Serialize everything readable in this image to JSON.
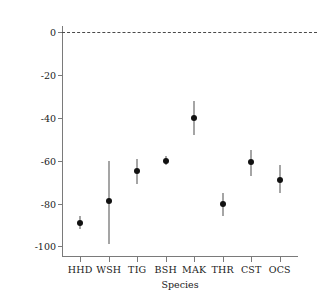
{
  "chart_data": {
    "type": "scatter",
    "title": "",
    "xlabel": "Species",
    "ylabel": "Estimated change in abundance",
    "categories": [
      "HHD",
      "WSH",
      "TIG",
      "BSH",
      "MAK",
      "THR",
      "CST",
      "OCS"
    ],
    "values": [
      -89,
      -79,
      -65,
      -60,
      -40,
      -80,
      -60.5,
      -69
    ],
    "error_low": [
      -92,
      -99,
      -71,
      -62,
      -48,
      -86,
      -67,
      -75
    ],
    "error_high": [
      -86,
      -60,
      -59,
      -58,
      -32,
      -75,
      -55,
      -62
    ],
    "ylim": [
      -105,
      3
    ],
    "yticks": [
      0,
      -20,
      -40,
      -60,
      -80,
      -100
    ],
    "ytick_labels": [
      "0",
      "-20",
      "-40",
      "-60",
      "-80",
      "-100"
    ],
    "grid": false,
    "legend": "none",
    "annotations": [
      {
        "name": "zero-reference-line",
        "type": "hline",
        "y": 0,
        "style": "dashed"
      }
    ],
    "series": [
      {
        "name": "Estimated change in abundance",
        "points": [
          {
            "category": "HHD",
            "value": -89,
            "ci_low": -92,
            "ci_high": -86
          },
          {
            "category": "WSH",
            "value": -79,
            "ci_low": -99,
            "ci_high": -60
          },
          {
            "category": "TIG",
            "value": -65,
            "ci_low": -71,
            "ci_high": -59
          },
          {
            "category": "BSH",
            "value": -60,
            "ci_low": -62,
            "ci_high": -58
          },
          {
            "category": "MAK",
            "value": -40,
            "ci_low": -48,
            "ci_high": -32
          },
          {
            "category": "THR",
            "value": -80,
            "ci_low": -86,
            "ci_high": -75
          },
          {
            "category": "CST",
            "value": -60.5,
            "ci_low": -67,
            "ci_high": -55
          },
          {
            "category": "OCS",
            "value": -69,
            "ci_low": -75,
            "ci_high": -62
          }
        ]
      }
    ]
  }
}
